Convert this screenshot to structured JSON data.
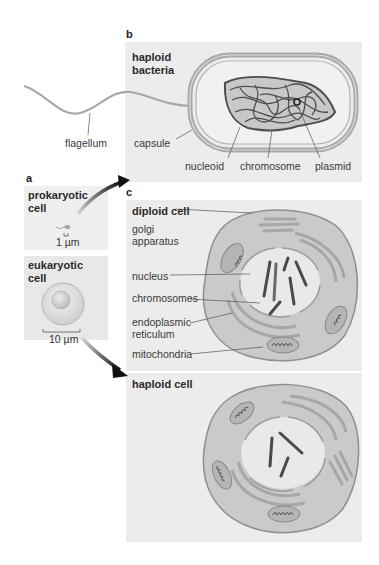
{
  "panels": {
    "a": {
      "letter": "a",
      "prokaryotic": {
        "title_line1": "prokaryotic",
        "title_line2": "cell",
        "scale": "1 µm"
      },
      "eukaryotic": {
        "title_line1": "eukaryotic",
        "title_line2": "cell",
        "scale": "10 µm"
      }
    },
    "b": {
      "letter": "b",
      "title_line1": "haploid",
      "title_line2": "bacteria",
      "labels": {
        "flagellum": "flagellum",
        "capsule": "capsule",
        "nucleoid": "nucleoid",
        "chromosome": "chromosome",
        "plasmid": "plasmid"
      }
    },
    "c": {
      "letter": "c",
      "diploid": {
        "title": "diploid cell",
        "labels": {
          "golgi_line1": "golgi",
          "golgi_line2": "apparatus",
          "nucleus": "nucleus",
          "chromosomes": "chromosomes",
          "er_line1": "endoplasmic",
          "er_line2": "reticulum",
          "mitochondria": "mitochondria"
        }
      },
      "haploid": {
        "title": "haploid cell"
      }
    }
  },
  "colors": {
    "panel_bg": "#ececec",
    "cell_fill": "#c9c9c9",
    "cell_edge": "#9a9a9a",
    "nucleus_fill": "#e6e6e6",
    "chromosome": "#4a4a4a",
    "arrow": "#1e1e1e"
  }
}
